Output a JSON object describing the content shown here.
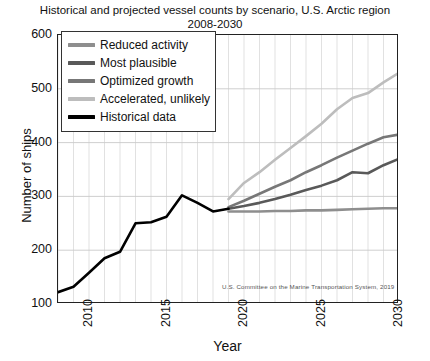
{
  "chart_data": {
    "type": "line",
    "title": "Historical and projected vessel counts by scenario, U.S. Arctic region\n2008-2030",
    "title_line1": "Historical and projected vessel counts by scenario, U.S. Arctic region",
    "title_line2": "2008-2030",
    "xlabel": "Year",
    "ylabel": "Number of ships",
    "xlim": [
      2008,
      2030
    ],
    "ylim": [
      100,
      600
    ],
    "yticks": [
      600,
      500,
      400,
      300,
      200,
      100
    ],
    "xticks": [
      2010,
      2015,
      2020,
      2025,
      2030
    ],
    "grid": "minor vertical gridlines every year, horizontal gridlines at each 100",
    "legend_position": "upper left inside axes",
    "annotations": [
      {
        "text": "U.S. Committee on the Marine Transportation System, 2019",
        "x": 2020.2,
        "y": 148
      }
    ],
    "series": [
      {
        "name": "Historical data",
        "color": "#000000",
        "linewidth": 2.6,
        "x": [
          2008,
          2009,
          2010,
          2011,
          2012,
          2013,
          2014,
          2015,
          2016,
          2017,
          2018,
          2019
        ],
        "values": [
          122,
          132,
          158,
          185,
          197,
          250,
          252,
          262,
          302,
          288,
          272,
          277
        ]
      },
      {
        "name": "Reduced activity",
        "color": "#8e8e8e",
        "linewidth": 2.6,
        "x": [
          2019,
          2020,
          2021,
          2022,
          2023,
          2024,
          2025,
          2026,
          2027,
          2028,
          2029,
          2030
        ],
        "values": [
          272,
          272,
          272,
          273,
          273,
          274,
          274,
          275,
          276,
          277,
          278,
          278
        ]
      },
      {
        "name": "Most plausible",
        "color": "#595959",
        "linewidth": 2.6,
        "x": [
          2019,
          2020,
          2021,
          2022,
          2023,
          2024,
          2025,
          2026,
          2027,
          2028,
          2029,
          2030
        ],
        "values": [
          277,
          282,
          288,
          295,
          303,
          312,
          320,
          330,
          345,
          343,
          358,
          370
        ]
      },
      {
        "name": "Optimized growth",
        "color": "#777777",
        "linewidth": 2.6,
        "x": [
          2019,
          2020,
          2021,
          2022,
          2023,
          2024,
          2025,
          2026,
          2027,
          2028,
          2029,
          2030
        ],
        "values": [
          280,
          292,
          305,
          318,
          330,
          345,
          358,
          372,
          385,
          398,
          410,
          415
        ]
      },
      {
        "name": "Accelerated, unlikely",
        "color": "#bdbdbd",
        "linewidth": 2.6,
        "x": [
          2019,
          2020,
          2021,
          2022,
          2023,
          2024,
          2025,
          2026,
          2027,
          2028,
          2029,
          2030
        ],
        "values": [
          295,
          325,
          345,
          368,
          390,
          412,
          435,
          462,
          483,
          492,
          512,
          530
        ]
      }
    ]
  },
  "legend": {
    "items": [
      {
        "label": "Reduced activity",
        "color": "#8e8e8e"
      },
      {
        "label": "Most plausible",
        "color": "#595959"
      },
      {
        "label": "Optimized growth",
        "color": "#777777"
      },
      {
        "label": "Accelerated, unlikely",
        "color": "#bdbdbd"
      },
      {
        "label": "Historical data",
        "color": "#000000"
      }
    ]
  },
  "axes": {
    "y_tick_labels": [
      "600",
      "500",
      "400",
      "300",
      "200",
      "100"
    ],
    "x_tick_labels": [
      "2010",
      "2015",
      "2020",
      "2025",
      "2030"
    ],
    "y_axis_label": "Number of ships",
    "x_axis_label": "Year"
  },
  "source": {
    "text": "U.S. Committee on the Marine Transportation System, 2019"
  },
  "colors": {
    "axis": "#222222",
    "gridline": "#d9d9d9",
    "text": "#111111",
    "background": "#ffffff"
  }
}
